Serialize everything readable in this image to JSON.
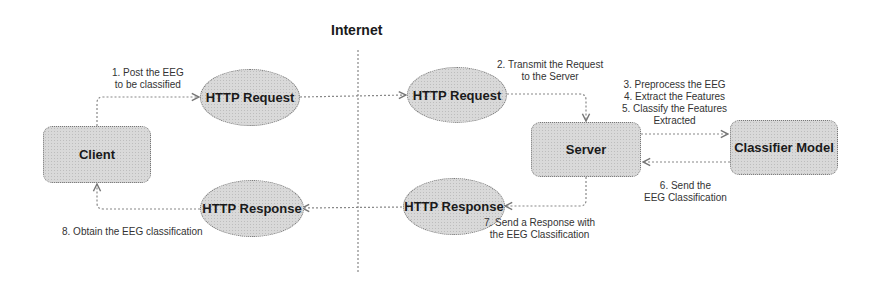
{
  "diagram": {
    "title": "Internet",
    "nodes": {
      "client": "Client",
      "http_request_left": "HTTP Request",
      "http_response_left": "HTTP Response",
      "http_request_right": "HTTP Request",
      "http_response_right": "HTTP Response",
      "server": "Server",
      "classifier": "Classifier Model"
    },
    "edges": {
      "step1": [
        "1. Post the EEG",
        "to be classified"
      ],
      "step2": [
        "2. Transmit the Request",
        "to the Server"
      ],
      "step3_5": [
        "3. Preprocess the EEG",
        "4. Extract the Features",
        "5. Classify the Features",
        "Extracted"
      ],
      "step6": [
        "6. Send the",
        "EEG Classification"
      ],
      "step7": [
        "7. Send a Response with",
        "the EEG Classification"
      ],
      "step8": [
        "8. Obtain the EEG classification"
      ]
    },
    "colors": {
      "node_fill": "#d9d9d9",
      "border": "#777777",
      "line": "#888888",
      "text": "#1a1a1a"
    }
  }
}
